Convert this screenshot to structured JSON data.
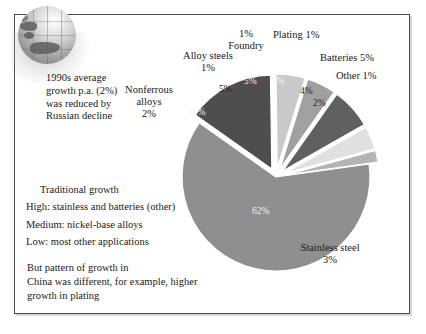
{
  "slide": {
    "frame_border_color": "#4a4a4a",
    "background": "#ffffff"
  },
  "decoration": {
    "globe_icon": "globe-icon"
  },
  "notes": {
    "intro": "1990s average growth p.a. (2%) was reduced by Russian decline",
    "growth_heading": "Traditional growth",
    "growth_lines": [
      "High: stainless and batteries (other)",
      "Medium: nickel-base alloys",
      "Low: most other applications"
    ],
    "china_lines": [
      "But pattern of growth in",
      "China was different, for example, higher",
      "growth in plating"
    ]
  },
  "chart_data": {
    "type": "pie",
    "title": "",
    "legend": "labels-outside",
    "start_angle_deg": 0,
    "direction": "clockwise",
    "categories": [
      "Stainless steel",
      "Nonferrous alloys",
      "Alloy steels",
      "Foundry",
      "Plating",
      "Batteries",
      "Other"
    ],
    "values": [
      62,
      15,
      5,
      5,
      7,
      4,
      2
    ],
    "value_labels": [
      "62%",
      "15%",
      "5%",
      "5%",
      "7%",
      "4%",
      "2%"
    ],
    "slice_colors": [
      "#8f8f8f",
      "#4e4e4e",
      "#c9c9c9",
      "#a0a0a0",
      "#606060",
      "#e0e0e0",
      "#b4b4b4"
    ],
    "exploded": [
      false,
      true,
      true,
      true,
      true,
      true,
      true
    ],
    "callouts": [
      {
        "name": "nonferrous",
        "text": "Nonferrous\nalloys\n2%",
        "value": "2%"
      },
      {
        "name": "alloy-steels",
        "text": "Alloy steels\n1%",
        "value": "1%"
      },
      {
        "name": "foundry",
        "text": "1%\nFoundry",
        "value": "1%"
      },
      {
        "name": "plating",
        "text": "Plating 1%",
        "value": "1%"
      },
      {
        "name": "batteries",
        "text": "Batteries 5%",
        "value": "5%"
      },
      {
        "name": "other",
        "text": "Other 1%",
        "value": "1%"
      },
      {
        "name": "stainless-steel",
        "text": "Stainless steel\n3%",
        "value": "3%"
      }
    ],
    "labels": {
      "nonferrous_l1": "Nonferrous",
      "nonferrous_l2": "alloys",
      "nonferrous_l3": "2%",
      "alloy_l1": "Alloy steels",
      "alloy_l2": "1%",
      "foundry_l1": "1%",
      "foundry_l2": "Foundry",
      "plating": "Plating 1%",
      "batteries": "Batteries 5%",
      "other": "Other 1%",
      "stainless_l1": "Stainless steel",
      "stainless_l2": "3%"
    },
    "inner_pcts": {
      "p62": "62%",
      "p15": "15%",
      "p5a": "5%",
      "p5b": "5%",
      "p7": "7%",
      "p4": "4%",
      "p2": "2%"
    }
  }
}
